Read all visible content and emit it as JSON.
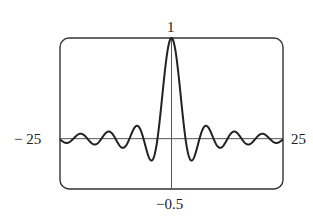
{
  "chart_data": {
    "type": "line",
    "title": "",
    "function": "sin(x)/x",
    "xlabel": "",
    "ylabel": "",
    "xlim": [
      -25,
      25
    ],
    "ylim": [
      -0.5,
      1
    ],
    "grid": false,
    "legend": null,
    "frame": "rounded-rectangle",
    "axes_through_origin": true,
    "tick_labels": {
      "x_min": "− 25",
      "x_max": "25",
      "y_max": "1",
      "y_min": "−0.5"
    },
    "series": [
      {
        "name": "sin(x)/x",
        "x": [
          -25,
          -20,
          -17.2,
          -15,
          -14.07,
          -12.57,
          -10.9,
          -9.42,
          -7.73,
          -6.28,
          -4.49,
          -3.14,
          -1.5,
          0,
          1.5,
          3.14,
          4.49,
          6.28,
          7.73,
          9.42,
          10.9,
          12.57,
          14.07,
          15,
          17.2,
          20,
          25
        ],
        "y": [
          -0.005,
          0.046,
          -0.058,
          0.043,
          0.071,
          0.0,
          -0.091,
          0.0,
          0.128,
          0.0,
          -0.217,
          0.0,
          0.665,
          1.0,
          0.665,
          0.0,
          -0.217,
          0.0,
          0.128,
          0.0,
          -0.091,
          0.0,
          0.071,
          0.043,
          -0.058,
          0.046,
          -0.005
        ]
      }
    ]
  }
}
